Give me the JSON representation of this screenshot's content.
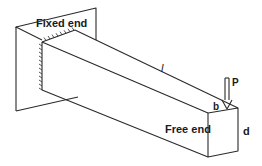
{
  "diagram": {
    "type": "cantilever-beam",
    "labels": {
      "fixed_end": "Fixed end",
      "free_end": "Free end",
      "length": "l",
      "load": "P",
      "width": "b",
      "depth": "d"
    },
    "colors": {
      "stroke": "#2a2a2a",
      "text": "#1a1a1a",
      "background": "#ffffff"
    }
  }
}
